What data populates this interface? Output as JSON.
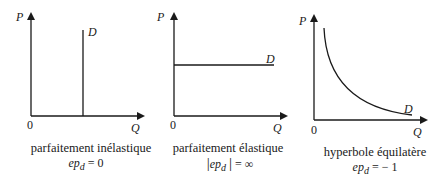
{
  "diagrams": [
    {
      "y_label": "P",
      "x_label": "Q",
      "origin": "0",
      "curve_label": "D",
      "caption": "parfaitement inélastique",
      "formula": {
        "prefix": "",
        "symbol": "ep",
        "sub": "d",
        "suffix": "",
        "rhs": "= 0"
      }
    },
    {
      "y_label": "P",
      "x_label": "Q",
      "origin": "0",
      "curve_label": "D",
      "caption": "parfaitement élastique",
      "formula": {
        "prefix": "|",
        "symbol": "ep",
        "sub": "d",
        "suffix": "|",
        "rhs": "= ∞"
      }
    },
    {
      "y_label": "P",
      "x_label": "Q",
      "origin": "0",
      "curve_label": "D",
      "caption": "hyperbole équilatère",
      "formula": {
        "prefix": "",
        "symbol": "ep",
        "sub": "d",
        "suffix": "",
        "rhs": "= − 1"
      }
    }
  ]
}
